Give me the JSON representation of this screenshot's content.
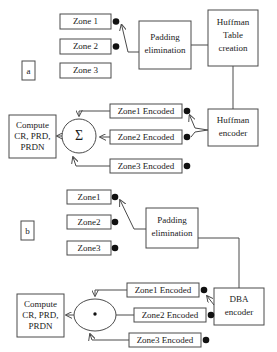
{
  "diagram": {
    "colors": {
      "stroke": "#4a4a4a",
      "text": "#1a1a1a",
      "dot": "#111111",
      "background": "#ffffff"
    },
    "panels": [
      {
        "id": "panel-a",
        "label": "a"
      },
      {
        "id": "panel-b",
        "label": "b"
      }
    ],
    "panel_a": {
      "zones": [
        {
          "label": "Zone 1",
          "has_dot": true
        },
        {
          "label": "Zone 2",
          "has_dot": true
        },
        {
          "label": "Zone 3",
          "has_dot": false
        }
      ],
      "padding_block": {
        "line1": "Padding",
        "line2": "elimination"
      },
      "table_block": {
        "line1": "Huffman",
        "line2": "Table",
        "line3": "creation"
      },
      "encoder_block": {
        "line1": "Huffman",
        "line2": "encoder"
      },
      "encoded_zones": [
        {
          "label": "Zone1 Encoded",
          "has_dot": true
        },
        {
          "label": "Zone2 Encoded",
          "has_dot": true
        },
        {
          "label": "Zone3 Encoded",
          "has_dot": true
        }
      ],
      "operator": {
        "symbol": "Σ",
        "kind": "summation"
      },
      "compute_block": {
        "line1": "Compute",
        "line2": "CR, PRD,",
        "line3": "PRDN"
      }
    },
    "panel_b": {
      "zones": [
        {
          "label": "Zone1",
          "has_dot": true
        },
        {
          "label": "Zone2",
          "has_dot": true
        },
        {
          "label": "Zone3",
          "has_dot": true
        }
      ],
      "padding_block": {
        "line1": "Padding",
        "line2": "elimination"
      },
      "encoder_block": {
        "line1": "DBA",
        "line2": "encoder"
      },
      "encoded_zones": [
        {
          "label": "Zone1 Encoded",
          "has_dot": true
        },
        {
          "label": "Zone2 Encoded",
          "has_dot": true
        },
        {
          "label": "Zone3 Encoded",
          "has_dot": true
        }
      ],
      "operator": {
        "symbol": "·",
        "kind": "product"
      },
      "compute_block": {
        "line1": "Compute",
        "line2": "CR, PRD,",
        "line3": "PRDN"
      }
    }
  }
}
